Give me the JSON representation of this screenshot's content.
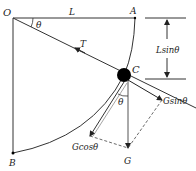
{
  "diagram": {
    "points": {
      "O": "O",
      "A": "A",
      "B": "B",
      "C": "C"
    },
    "labels": {
      "length": "L",
      "angle_top": "θ",
      "angle_c": "θ",
      "tension": "T",
      "height": "Lsinθ",
      "gravity": "G",
      "g_sin": "Gsinθ",
      "g_cos": "Gcosθ"
    },
    "colors": {
      "line": "#333333",
      "ball": "#000000",
      "background": "#ffffff"
    }
  }
}
